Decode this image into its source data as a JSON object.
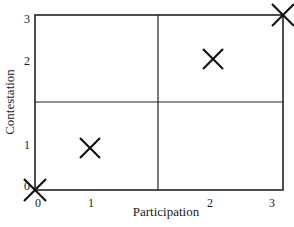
{
  "chart_data": {
    "type": "scatter",
    "title": "",
    "xlabel": "Participation",
    "ylabel": "Contestation",
    "xlim": [
      0,
      3
    ],
    "ylim": [
      0,
      3
    ],
    "grid": "quadrant dividers at midpoint (1.5, 1.5)",
    "marker": "X",
    "x_ticks": [
      "0",
      "1",
      "2",
      "3"
    ],
    "y_ticks": [
      "0",
      "1",
      "2",
      "3"
    ],
    "points": [
      {
        "x": 0,
        "y": 0
      },
      {
        "x": 1,
        "y": 1
      },
      {
        "x": 2,
        "y": 2
      },
      {
        "x": 3,
        "y": 3
      }
    ]
  },
  "axes": {
    "x_label": "Participation",
    "y_label": "Contestation",
    "x_ticks": [
      {
        "label": "0",
        "px": 38,
        "py": 203
      },
      {
        "label": "1",
        "px": 91,
        "py": 203
      },
      {
        "label": "2",
        "px": 210,
        "py": 203
      },
      {
        "label": "3",
        "px": 272,
        "py": 203
      }
    ],
    "y_ticks": [
      {
        "label": "3",
        "px": 27,
        "py": 19
      },
      {
        "label": "2",
        "px": 27,
        "py": 61
      },
      {
        "label": "1",
        "px": 27,
        "py": 145
      },
      {
        "label": "0",
        "px": 27,
        "py": 186
      }
    ]
  },
  "frame": {
    "left": 35,
    "top": 15,
    "right": 283,
    "bottom": 190,
    "mid_x": 158,
    "mid_y": 102,
    "stroke": "#222222"
  },
  "markers": [
    {
      "cx": 35,
      "cy": 190,
      "size": 22
    },
    {
      "cx": 90,
      "cy": 148,
      "size": 20
    },
    {
      "cx": 213,
      "cy": 59,
      "size": 20
    },
    {
      "cx": 283,
      "cy": 15,
      "size": 22
    }
  ]
}
